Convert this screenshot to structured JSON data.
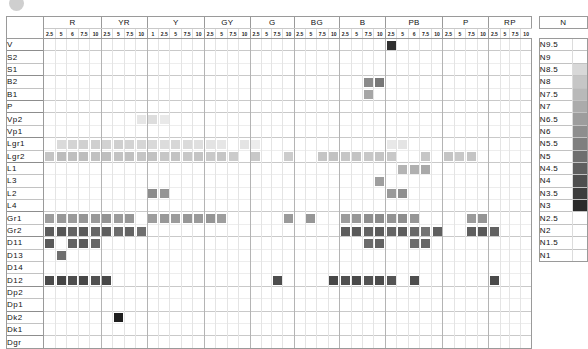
{
  "top_strip": {
    "caption": "　　　　　　　　　",
    "bullet_icon": "filled-circle-icon"
  },
  "chart_data": {
    "type": "heatmap",
    "title": "",
    "xlabel": "",
    "ylabel": "",
    "grid": true,
    "legend_position": "right",
    "hue_groups": [
      {
        "label": "R",
        "ticks": [
          "2.5",
          "5",
          "6",
          "7.5",
          "10"
        ]
      },
      {
        "label": "YR",
        "ticks": [
          "2.5",
          "5",
          "7.5",
          "10"
        ]
      },
      {
        "label": "Y",
        "ticks": [
          "1",
          "2.5",
          "5",
          "7.5",
          "10"
        ]
      },
      {
        "label": "GY",
        "ticks": [
          "2.5",
          "5",
          "7.5",
          "10"
        ]
      },
      {
        "label": "G",
        "ticks": [
          "2.5",
          "5",
          "7.5",
          "10"
        ]
      },
      {
        "label": "BG",
        "ticks": [
          "2.5",
          "5",
          "7.5",
          "10"
        ]
      },
      {
        "label": "B",
        "ticks": [
          "2.5",
          "5",
          "7.5",
          "10"
        ]
      },
      {
        "label": "PB",
        "ticks": [
          "2.5",
          "5",
          "6",
          "7.5",
          "10"
        ]
      },
      {
        "label": "P",
        "ticks": [
          "2.5",
          "5",
          "7.5",
          "10"
        ]
      },
      {
        "label": "RP",
        "ticks": [
          "2.5",
          "5",
          "7.5",
          "10"
        ]
      }
    ],
    "columns": 40,
    "row_labels": [
      "V",
      "S2",
      "S1",
      "B2",
      "B1",
      "P",
      "Vp2",
      "Vp1",
      "Lgr1",
      "Lgr2",
      "L1",
      "L3",
      "L2",
      "L4",
      "Gr1",
      "Gr2",
      "D11",
      "D13",
      "D14",
      "D12",
      "Dp2",
      "Dp1",
      "Dk2",
      "Dk1",
      "Dgr"
    ],
    "band_starts": [
      0,
      1,
      3,
      5,
      6,
      8,
      10,
      14,
      16,
      20,
      22,
      24
    ],
    "cells": [
      {
        "row": "V",
        "col": 30,
        "color": "#2f2f2f"
      },
      {
        "row": "B2",
        "col": 28,
        "color": "#8a8a8a"
      },
      {
        "row": "B2",
        "col": 29,
        "color": "#777777"
      },
      {
        "row": "B1",
        "col": 28,
        "color": "#a6a6a6"
      },
      {
        "row": "Vp2",
        "col": 8,
        "color": "#e6e6e6"
      },
      {
        "row": "Vp2",
        "col": 9,
        "color": "#dddddd"
      },
      {
        "row": "Vp2",
        "col": 10,
        "color": "#e9e9e9"
      },
      {
        "row": "Lgr1",
        "col": 1,
        "color": "#dadada"
      },
      {
        "row": "Lgr1",
        "col": 2,
        "color": "#d4d4d4"
      },
      {
        "row": "Lgr1",
        "col": 3,
        "color": "#d0d0d0"
      },
      {
        "row": "Lgr1",
        "col": 4,
        "color": "#cfcfcf"
      },
      {
        "row": "Lgr1",
        "col": 5,
        "color": "#d2d2d2"
      },
      {
        "row": "Lgr1",
        "col": 6,
        "color": "#cfcfcf"
      },
      {
        "row": "Lgr1",
        "col": 7,
        "color": "#d3d3d3"
      },
      {
        "row": "Lgr1",
        "col": 8,
        "color": "#d6d6d6"
      },
      {
        "row": "Lgr1",
        "col": 9,
        "color": "#d9d9d9"
      },
      {
        "row": "Lgr1",
        "col": 10,
        "color": "#dcdcdc"
      },
      {
        "row": "Lgr1",
        "col": 11,
        "color": "#d7d7d7"
      },
      {
        "row": "Lgr1",
        "col": 12,
        "color": "#dadada"
      },
      {
        "row": "Lgr1",
        "col": 13,
        "color": "#dfdfdf"
      },
      {
        "row": "Lgr1",
        "col": 14,
        "color": "#e3e3e3"
      },
      {
        "row": "Lgr1",
        "col": 15,
        "color": "#e6e6e6"
      },
      {
        "row": "Lgr1",
        "col": 17,
        "color": "#e4e4e4"
      },
      {
        "row": "Lgr1",
        "col": 18,
        "color": "#ececec"
      },
      {
        "row": "Lgr1",
        "col": 30,
        "color": "#e8e8e8"
      },
      {
        "row": "Lgr1",
        "col": 31,
        "color": "#e4e4e4"
      },
      {
        "row": "Lgr2",
        "col": 0,
        "color": "#c4c4c4"
      },
      {
        "row": "Lgr2",
        "col": 1,
        "color": "#bcbcbc"
      },
      {
        "row": "Lgr2",
        "col": 2,
        "color": "#bfbfbf"
      },
      {
        "row": "Lgr2",
        "col": 3,
        "color": "#bdbdbd"
      },
      {
        "row": "Lgr2",
        "col": 4,
        "color": "#c1c1c1"
      },
      {
        "row": "Lgr2",
        "col": 5,
        "color": "#bebebe"
      },
      {
        "row": "Lgr2",
        "col": 6,
        "color": "#c3c3c3"
      },
      {
        "row": "Lgr2",
        "col": 7,
        "color": "#c0c0c0"
      },
      {
        "row": "Lgr2",
        "col": 8,
        "color": "#c5c5c5"
      },
      {
        "row": "Lgr2",
        "col": 9,
        "color": "#c2c2c2"
      },
      {
        "row": "Lgr2",
        "col": 10,
        "color": "#c6c6c6"
      },
      {
        "row": "Lgr2",
        "col": 11,
        "color": "#c3c3c3"
      },
      {
        "row": "Lgr2",
        "col": 12,
        "color": "#c7c7c7"
      },
      {
        "row": "Lgr2",
        "col": 13,
        "color": "#c4c4c4"
      },
      {
        "row": "Lgr2",
        "col": 14,
        "color": "#c9c9c9"
      },
      {
        "row": "Lgr2",
        "col": 15,
        "color": "#c6c6c6"
      },
      {
        "row": "Lgr2",
        "col": 16,
        "color": "#cbcbcb"
      },
      {
        "row": "Lgr2",
        "col": 18,
        "color": "#c8c8c8"
      },
      {
        "row": "Lgr2",
        "col": 21,
        "color": "#cccccc"
      },
      {
        "row": "Lgr2",
        "col": 24,
        "color": "#c5c5c5"
      },
      {
        "row": "Lgr2",
        "col": 25,
        "color": "#c2c2c2"
      },
      {
        "row": "Lgr2",
        "col": 26,
        "color": "#c6c6c6"
      },
      {
        "row": "Lgr2",
        "col": 27,
        "color": "#c3c3c3"
      },
      {
        "row": "Lgr2",
        "col": 28,
        "color": "#c7c7c7"
      },
      {
        "row": "Lgr2",
        "col": 29,
        "color": "#c4c4c4"
      },
      {
        "row": "Lgr2",
        "col": 30,
        "color": "#c8c8c8"
      },
      {
        "row": "Lgr2",
        "col": 33,
        "color": "#c6c6c6"
      },
      {
        "row": "Lgr2",
        "col": 35,
        "color": "#c4c4c4"
      },
      {
        "row": "Lgr2",
        "col": 36,
        "color": "#c8c8c8"
      },
      {
        "row": "Lgr2",
        "col": 37,
        "color": "#c5c5c5"
      },
      {
        "row": "L1",
        "col": 31,
        "color": "#b4b4b4"
      },
      {
        "row": "L1",
        "col": 32,
        "color": "#b0b0b0"
      },
      {
        "row": "L1",
        "col": 33,
        "color": "#a9a9a9"
      },
      {
        "row": "L3",
        "col": 29,
        "color": "#9e9e9e"
      },
      {
        "row": "L2",
        "col": 9,
        "color": "#8c8c8c"
      },
      {
        "row": "L2",
        "col": 10,
        "color": "#949494"
      },
      {
        "row": "L2",
        "col": 30,
        "color": "#9a9a9a"
      },
      {
        "row": "L2",
        "col": 31,
        "color": "#8f8f8f"
      },
      {
        "row": "Gr1",
        "col": 0,
        "color": "#9c9c9c"
      },
      {
        "row": "Gr1",
        "col": 1,
        "color": "#979797"
      },
      {
        "row": "Gr1",
        "col": 2,
        "color": "#9a9a9a"
      },
      {
        "row": "Gr1",
        "col": 3,
        "color": "#959595"
      },
      {
        "row": "Gr1",
        "col": 4,
        "color": "#999999"
      },
      {
        "row": "Gr1",
        "col": 5,
        "color": "#939393"
      },
      {
        "row": "Gr1",
        "col": 6,
        "color": "#9b9b9b"
      },
      {
        "row": "Gr1",
        "col": 7,
        "color": "#969696"
      },
      {
        "row": "Gr1",
        "col": 9,
        "color": "#9d9d9d"
      },
      {
        "row": "Gr1",
        "col": 10,
        "color": "#989898"
      },
      {
        "row": "Gr1",
        "col": 11,
        "color": "#9c9c9c"
      },
      {
        "row": "Gr1",
        "col": 12,
        "color": "#979797"
      },
      {
        "row": "Gr1",
        "col": 13,
        "color": "#9a9a9a"
      },
      {
        "row": "Gr1",
        "col": 14,
        "color": "#959595"
      },
      {
        "row": "Gr1",
        "col": 15,
        "color": "#9e9e9e"
      },
      {
        "row": "Gr1",
        "col": 21,
        "color": "#9a9a9a"
      },
      {
        "row": "Gr1",
        "col": 23,
        "color": "#969696"
      },
      {
        "row": "Gr1",
        "col": 26,
        "color": "#9c9c9c"
      },
      {
        "row": "Gr1",
        "col": 27,
        "color": "#979797"
      },
      {
        "row": "Gr1",
        "col": 28,
        "color": "#8e8e8e"
      },
      {
        "row": "Gr1",
        "col": 29,
        "color": "#8a8a8a"
      },
      {
        "row": "Gr1",
        "col": 30,
        "color": "#939393"
      },
      {
        "row": "Gr1",
        "col": 31,
        "color": "#8d8d8d"
      },
      {
        "row": "Gr1",
        "col": 32,
        "color": "#959595"
      },
      {
        "row": "Gr1",
        "col": 37,
        "color": "#9a9a9a"
      },
      {
        "row": "Gr1",
        "col": 38,
        "color": "#949494"
      },
      {
        "row": "Gr2",
        "col": 0,
        "color": "#5c5c5c"
      },
      {
        "row": "Gr2",
        "col": 1,
        "color": "#565656"
      },
      {
        "row": "Gr2",
        "col": 2,
        "color": "#636363"
      },
      {
        "row": "Gr2",
        "col": 3,
        "color": "#5a5a5a"
      },
      {
        "row": "Gr2",
        "col": 4,
        "color": "#666666"
      },
      {
        "row": "Gr2",
        "col": 5,
        "color": "#5e5e5e"
      },
      {
        "row": "Gr2",
        "col": 6,
        "color": "#6b6b6b"
      },
      {
        "row": "Gr2",
        "col": 7,
        "color": "#636363"
      },
      {
        "row": "Gr2",
        "col": 8,
        "color": "#6f6f6f"
      },
      {
        "row": "Gr2",
        "col": 26,
        "color": "#5d5d5d"
      },
      {
        "row": "Gr2",
        "col": 27,
        "color": "#585858"
      },
      {
        "row": "Gr2",
        "col": 28,
        "color": "#616161"
      },
      {
        "row": "Gr2",
        "col": 29,
        "color": "#5a5a5a"
      },
      {
        "row": "Gr2",
        "col": 30,
        "color": "#646464"
      },
      {
        "row": "Gr2",
        "col": 31,
        "color": "#5c5c5c"
      },
      {
        "row": "Gr2",
        "col": 32,
        "color": "#686868"
      },
      {
        "row": "Gr2",
        "col": 33,
        "color": "#737373"
      },
      {
        "row": "Gr2",
        "col": 34,
        "color": "#5f5f5f"
      },
      {
        "row": "Gr2",
        "col": 37,
        "color": "#5e5e5e"
      },
      {
        "row": "Gr2",
        "col": 38,
        "color": "#585858"
      },
      {
        "row": "Gr2",
        "col": 39,
        "color": "#626262"
      },
      {
        "row": "D11",
        "col": 0,
        "color": "#5a5a5a"
      },
      {
        "row": "D11",
        "col": 2,
        "color": "#626262"
      },
      {
        "row": "D11",
        "col": 3,
        "color": "#5b5b5b"
      },
      {
        "row": "D11",
        "col": 4,
        "color": "#666666"
      },
      {
        "row": "D11",
        "col": 28,
        "color": "#6a6a6a"
      },
      {
        "row": "D11",
        "col": 29,
        "color": "#636363"
      },
      {
        "row": "D11",
        "col": 32,
        "color": "#6d6d6d"
      },
      {
        "row": "D11",
        "col": 33,
        "color": "#666666"
      },
      {
        "row": "D13",
        "col": 1,
        "color": "#6e6e6e"
      },
      {
        "row": "D12",
        "col": 0,
        "color": "#4a4a4a"
      },
      {
        "row": "D12",
        "col": 1,
        "color": "#444444"
      },
      {
        "row": "D12",
        "col": 2,
        "color": "#4e4e4e"
      },
      {
        "row": "D12",
        "col": 3,
        "color": "#474747"
      },
      {
        "row": "D12",
        "col": 4,
        "color": "#515151"
      },
      {
        "row": "D12",
        "col": 5,
        "color": "#484848"
      },
      {
        "row": "D12",
        "col": 20,
        "color": "#4d4d4d"
      },
      {
        "row": "D12",
        "col": 25,
        "color": "#474747"
      },
      {
        "row": "D12",
        "col": 26,
        "color": "#505050"
      },
      {
        "row": "D12",
        "col": 27,
        "color": "#494949"
      },
      {
        "row": "D12",
        "col": 28,
        "color": "#525252"
      },
      {
        "row": "D12",
        "col": 29,
        "color": "#4b4b4b"
      },
      {
        "row": "D12",
        "col": 30,
        "color": "#545454"
      },
      {
        "row": "D12",
        "col": 32,
        "color": "#4e4e4e"
      },
      {
        "row": "D12",
        "col": 39,
        "color": "#4a4a4a"
      },
      {
        "row": "Dk2",
        "col": 6,
        "color": "#1f1f1f"
      }
    ],
    "n_scale": {
      "header": "N",
      "steps": [
        {
          "label": "N9.5",
          "swatch": null
        },
        {
          "label": "N9",
          "swatch": null
        },
        {
          "label": "N8.5",
          "swatch": "#d8d8d8"
        },
        {
          "label": "N8",
          "swatch": "#c6c6c6"
        },
        {
          "label": "N7.5",
          "swatch": "#b9b9b9"
        },
        {
          "label": "N7",
          "swatch": "#ababab"
        },
        {
          "label": "N6.5",
          "swatch": "#9d9d9d"
        },
        {
          "label": "N6",
          "swatch": "#8e8e8e"
        },
        {
          "label": "N5.5",
          "swatch": "#7f7f7f"
        },
        {
          "label": "N5",
          "swatch": "#6f6f6f"
        },
        {
          "label": "N4.5",
          "swatch": "#5f5f5f"
        },
        {
          "label": "N4",
          "swatch": "#4f4f4f"
        },
        {
          "label": "N3.5",
          "swatch": "#3d3d3d"
        },
        {
          "label": "N3",
          "swatch": "#2a2a2a"
        },
        {
          "label": "N2.5",
          "swatch": null
        },
        {
          "label": "N2",
          "swatch": null
        },
        {
          "label": "N1.5",
          "swatch": null
        },
        {
          "label": "N1",
          "swatch": null
        }
      ]
    }
  }
}
